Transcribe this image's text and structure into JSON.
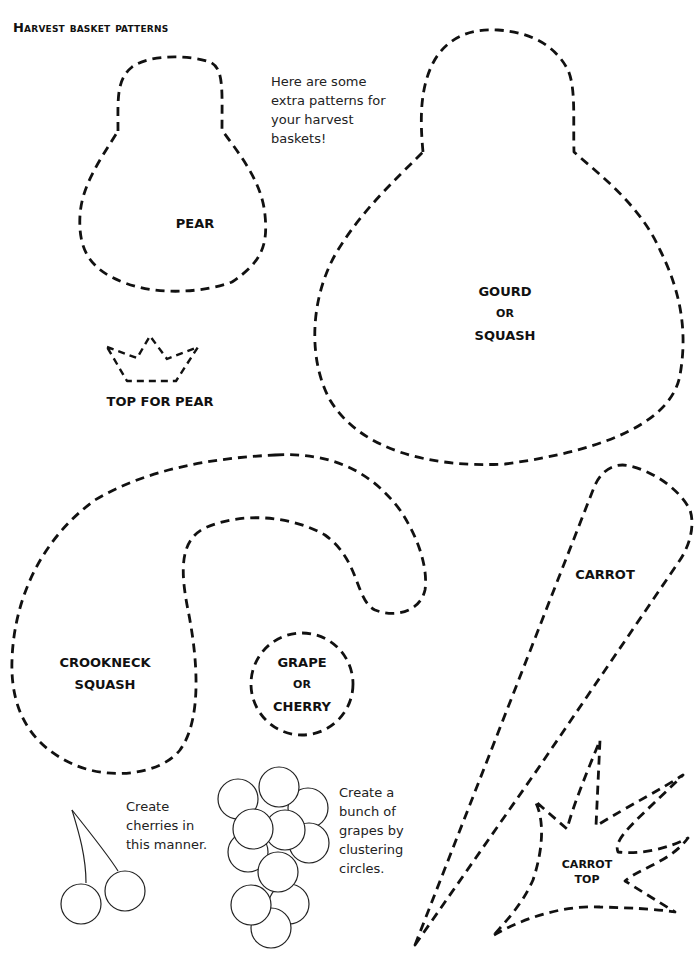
{
  "page": {
    "title": "Harvest basket patterns",
    "intro_note": [
      "Here are some",
      "extra patterns for",
      "your harvest",
      "baskets!"
    ]
  },
  "patterns": {
    "pear": {
      "label": "PEAR"
    },
    "pear_top": {
      "label": "TOP FOR PEAR"
    },
    "gourd": {
      "line1": "GOURD",
      "line2": "OR",
      "line3": "SQUASH"
    },
    "crookneck": {
      "line1": "CROOKNECK",
      "line2": "SQUASH"
    },
    "grape": {
      "line1": "GRAPE",
      "line2": "OR",
      "line3": "CHERRY"
    },
    "carrot": {
      "label": "CARROT"
    },
    "carrot_top": {
      "line1": "CARROT",
      "line2": "TOP"
    }
  },
  "notes": {
    "cherries": [
      "Create",
      "cherries in",
      "this manner."
    ],
    "grapes": [
      "Create a",
      "bunch of",
      "grapes by",
      "clustering",
      "circles."
    ]
  }
}
